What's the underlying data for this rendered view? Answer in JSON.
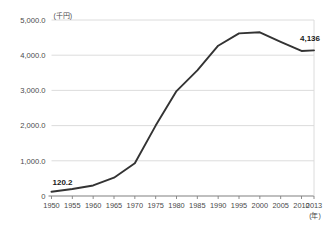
{
  "chart_data": {
    "type": "line",
    "title": "",
    "subtitle": "",
    "xlabel": "(年)",
    "ylabel": "(千円)",
    "y_unit_label": "(千円)",
    "x_unit_label": "(年)",
    "grid": true,
    "legend": "none",
    "xlim": [
      1950,
      2013
    ],
    "ylim": [
      0,
      5000
    ],
    "x": [
      1950,
      1955,
      1960,
      1965,
      1970,
      1975,
      1980,
      1985,
      1990,
      1995,
      2000,
      2005,
      2010,
      2013
    ],
    "values": [
      120.2,
      200,
      300,
      520,
      930,
      2000,
      2980,
      3570,
      4270,
      4620,
      4650,
      4380,
      4120,
      4136
    ],
    "series": [
      {
        "name": "",
        "color": "#333333",
        "values": [
          120.2,
          200,
          300,
          520,
          930,
          2000,
          2980,
          3570,
          4270,
          4620,
          4650,
          4380,
          4120,
          4136
        ]
      }
    ],
    "categories": [
      "1950",
      "1955",
      "1960",
      "1965",
      "1970",
      "1975",
      "1980",
      "1985",
      "1990",
      "1995",
      "2000",
      "2005",
      "2010",
      "2013"
    ],
    "xticks": [
      "1950",
      "1955",
      "1960",
      "1965",
      "1970",
      "1975",
      "1980",
      "1985",
      "1990",
      "1995",
      "2000",
      "2005",
      "2010",
      "2013"
    ],
    "xtick_values": [
      1950,
      1955,
      1960,
      1965,
      1970,
      1975,
      1980,
      1985,
      1990,
      1995,
      2000,
      2005,
      2010,
      2013
    ],
    "yticks": [
      "0",
      "1,000.0",
      "2,000.0",
      "3,000.0",
      "4,000.0",
      "5,000.0"
    ],
    "ytick_values": [
      0,
      1000,
      2000,
      3000,
      4000,
      5000
    ],
    "annotations": [
      {
        "name": "first-point-label",
        "text": "120.2",
        "x": 1950,
        "y": 120.2
      },
      {
        "name": "last-point-label",
        "text": "4,136",
        "x": 2013,
        "y": 4136
      }
    ],
    "marker_line_year": 2013,
    "colors": {
      "line": "#333333",
      "grid": "#d8d8d8",
      "axis": "#808080",
      "text": "#4a4a4a",
      "background": "#ffffff"
    }
  },
  "labels": {
    "y_unit": "(千円)",
    "x_unit": "(年)",
    "first_value": "120.2",
    "last_value": "4,136"
  }
}
